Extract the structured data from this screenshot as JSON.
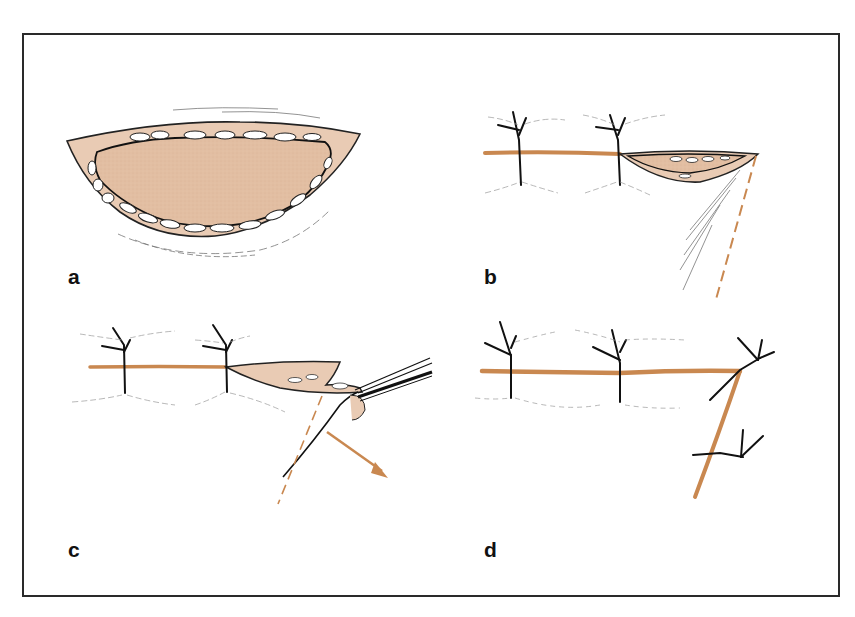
{
  "figure": {
    "type": "surgical-technique-illustration",
    "panel_count": 4,
    "colors": {
      "frame": "#2a2a2a",
      "wound_fill": "#e2bea2",
      "suture_line": "#c98850",
      "ink": "#111111",
      "fat_lobules": "#ffffff",
      "hatching": "#9a9a9a"
    }
  },
  "panels": [
    {
      "id": "a",
      "label": "a",
      "content": "open elliptical wound with exposed subcutaneous fat edges"
    },
    {
      "id": "b",
      "label": "b",
      "content": "wound partially closed with two interrupted sutures; dashed relaxing incision line"
    },
    {
      "id": "c",
      "label": "c",
      "content": "flap elevated with forceps along dashed line; arrow indicating direction of advancement"
    },
    {
      "id": "d",
      "label": "d",
      "content": "completed closure with interrupted sutures along horizontal and oblique suture lines"
    }
  ]
}
